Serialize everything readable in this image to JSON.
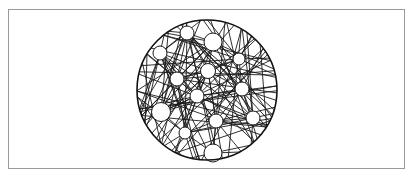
{
  "figure": {
    "frame": {
      "x": 8,
      "y": 9,
      "width": 397,
      "height": 160,
      "border_color": "#9a9a9a"
    },
    "boundary": {
      "cx": 207,
      "cy": 90,
      "r": 70,
      "stroke": "#111111"
    },
    "line_color": "#1a1a1a",
    "background": "#ffffff",
    "nodes": [
      {
        "id": "A",
        "cx": 187,
        "cy": 33,
        "r": 7
      },
      {
        "id": "B",
        "cx": 213,
        "cy": 42,
        "r": 9
      },
      {
        "id": "C",
        "cx": 160,
        "cy": 53,
        "r": 7
      },
      {
        "id": "D",
        "cx": 239,
        "cy": 59,
        "r": 6
      },
      {
        "id": "E",
        "cx": 208,
        "cy": 71,
        "r": 7.5
      },
      {
        "id": "F",
        "cx": 177,
        "cy": 79,
        "r": 7
      },
      {
        "id": "G",
        "cx": 197,
        "cy": 96,
        "r": 7
      },
      {
        "id": "H",
        "cx": 242,
        "cy": 89,
        "r": 7
      },
      {
        "id": "I",
        "cx": 161,
        "cy": 112,
        "r": 9.5
      },
      {
        "id": "J",
        "cx": 216,
        "cy": 121,
        "r": 7
      },
      {
        "id": "K",
        "cx": 253,
        "cy": 118,
        "r": 7
      },
      {
        "id": "L",
        "cx": 185,
        "cy": 133,
        "r": 6
      },
      {
        "id": "M",
        "cx": 213,
        "cy": 153,
        "r": 9
      }
    ]
  }
}
